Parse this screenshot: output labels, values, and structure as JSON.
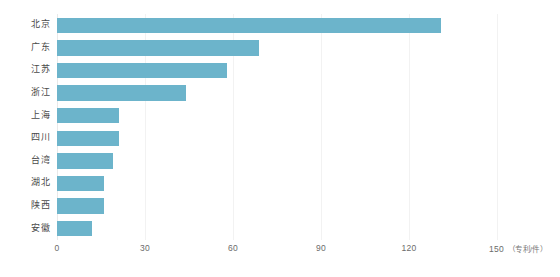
{
  "chart_data": {
    "type": "bar",
    "orientation": "horizontal",
    "title": "",
    "subtitle": "",
    "xlabel": "",
    "ylabel": "",
    "unit_label": "（专利/件）",
    "categories": [
      "北京",
      "广东",
      "江苏",
      "浙江",
      "上海",
      "四川",
      "台湾",
      "湖北",
      "陕西",
      "安徽"
    ],
    "values": [
      131,
      69,
      58,
      44,
      21,
      21,
      19,
      16,
      16,
      12
    ],
    "series": [
      {
        "name": "专利数量",
        "values": [
          131,
          69,
          58,
          44,
          21,
          21,
          19,
          16,
          16,
          12
        ]
      }
    ],
    "xlim": [
      0,
      150
    ],
    "xticks": [
      0,
      30,
      60,
      90,
      120,
      150
    ],
    "xticklabels": [
      "0",
      "30",
      "60",
      "90",
      "120",
      "150"
    ],
    "grid": true,
    "grid_axis": "x",
    "legend": false,
    "legend_position": "none",
    "bar_color": "#6cb4cb",
    "gridline_color": "#f2f2f2",
    "background_color": "#ffffff",
    "tick_label_color": "#6b6b6b",
    "category_label_color": "#4a4a4a"
  }
}
